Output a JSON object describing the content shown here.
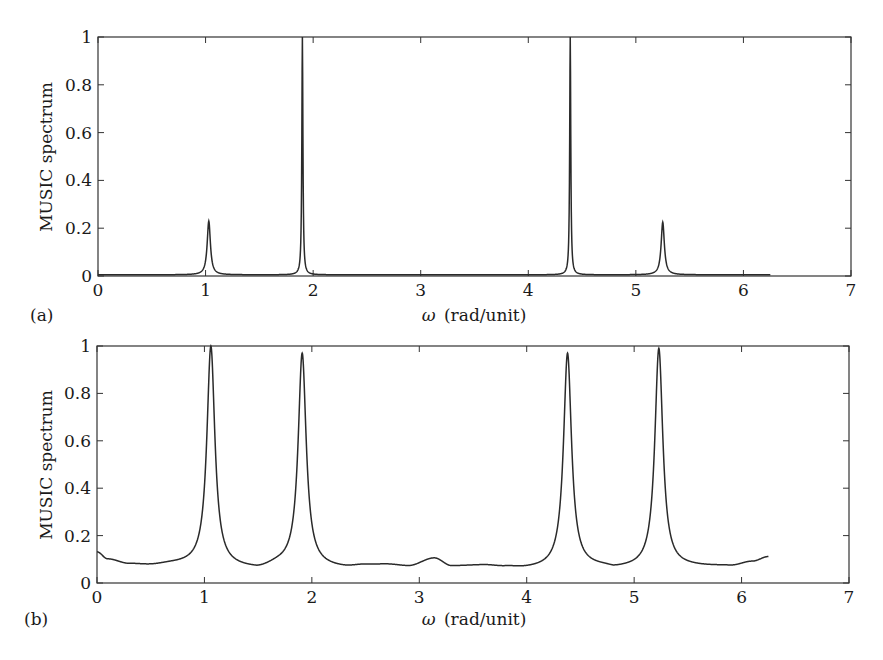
{
  "figure": {
    "panels": [
      {
        "id": "a",
        "panel_label": "(a)",
        "ylabel": "MUSIC spectrum",
        "xlabel_symbol": "ω",
        "xlabel_units": "(rad/unit)",
        "xticks": [
          "0",
          "1",
          "2",
          "3",
          "4",
          "5",
          "6",
          "7"
        ],
        "yticks": [
          "0",
          "0.2",
          "0.4",
          "0.6",
          "0.8",
          "1"
        ]
      },
      {
        "id": "b",
        "panel_label": "(b)",
        "ylabel": "MUSIC spectrum",
        "xlabel_symbol": "ω",
        "xlabel_units": "(rad/unit)",
        "xticks": [
          "0",
          "1",
          "2",
          "3",
          "4",
          "5",
          "6",
          "7"
        ],
        "yticks": [
          "0",
          "0.2",
          "0.4",
          "0.6",
          "0.8",
          "1"
        ]
      }
    ],
    "line_color": "#2a2a2a"
  },
  "chart_data": [
    {
      "type": "line",
      "panel": "(a)",
      "title": "",
      "xlabel": "ω (rad/unit)",
      "ylabel": "MUSIC spectrum",
      "xlim": [
        0,
        7
      ],
      "ylim": [
        0,
        1
      ],
      "grid": false,
      "legend": null,
      "x_range_of_data": [
        0,
        6.25
      ],
      "baseline": 0.005,
      "peaks": [
        {
          "x": 1.03,
          "y": 0.23,
          "width": 0.018
        },
        {
          "x": 1.9,
          "y": 1.0,
          "width": 0.006
        },
        {
          "x": 4.39,
          "y": 1.0,
          "width": 0.006
        },
        {
          "x": 5.25,
          "y": 0.225,
          "width": 0.018
        }
      ]
    },
    {
      "type": "line",
      "panel": "(b)",
      "title": "",
      "xlabel": "ω (rad/unit)",
      "ylabel": "MUSIC spectrum",
      "xlim": [
        0,
        7
      ],
      "ylim": [
        0,
        1
      ],
      "grid": false,
      "legend": null,
      "x_range_of_data": [
        0,
        6.25
      ],
      "baseline_points": [
        [
          0.0,
          0.13
        ],
        [
          0.1,
          0.1
        ],
        [
          0.3,
          0.08
        ],
        [
          0.5,
          0.075
        ],
        [
          0.7,
          0.08
        ],
        [
          1.5,
          0.065
        ],
        [
          1.7,
          0.08
        ],
        [
          2.3,
          0.065
        ],
        [
          2.5,
          0.075
        ],
        [
          2.7,
          0.078
        ],
        [
          2.9,
          0.072
        ],
        [
          3.14,
          0.105
        ],
        [
          3.3,
          0.072
        ],
        [
          3.6,
          0.075
        ],
        [
          3.8,
          0.068
        ],
        [
          4.0,
          0.062
        ],
        [
          4.7,
          0.07
        ],
        [
          4.85,
          0.065
        ],
        [
          5.6,
          0.07
        ],
        [
          5.9,
          0.072
        ],
        [
          6.1,
          0.09
        ],
        [
          6.25,
          0.11
        ]
      ],
      "peaks": [
        {
          "x": 1.06,
          "y": 1.0,
          "width": 0.045
        },
        {
          "x": 1.91,
          "y": 0.97,
          "width": 0.045
        },
        {
          "x": 4.38,
          "y": 0.97,
          "width": 0.045
        },
        {
          "x": 5.23,
          "y": 0.99,
          "width": 0.045
        }
      ]
    }
  ]
}
